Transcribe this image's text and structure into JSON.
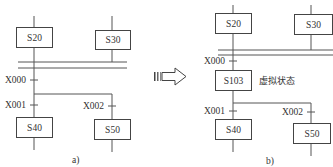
{
  "diagram_a": {
    "steps": {
      "s20": "S20",
      "s30": "S30",
      "s40": "S40",
      "s50": "S50"
    },
    "transitions": {
      "x000": "X000",
      "x001": "X001",
      "x002": "X002"
    },
    "caption": "a)"
  },
  "diagram_b": {
    "steps": {
      "s20": "S20",
      "s30": "S30",
      "s103": "S103",
      "s40": "S40",
      "s50": "S50"
    },
    "transitions": {
      "x000": "X000",
      "x001": "X001",
      "x002": "X002"
    },
    "virtual_state_label": "虚拟状态",
    "caption": "b)"
  },
  "arrow": {
    "icon": "right-arrow-icon"
  }
}
